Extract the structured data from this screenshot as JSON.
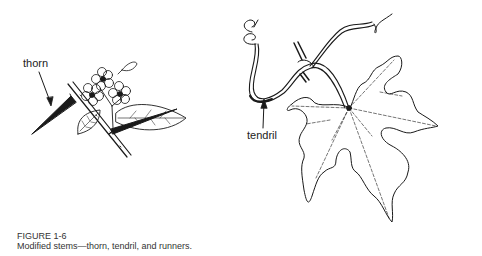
{
  "figure": {
    "number": "FIGURE 1-6",
    "caption": "Modified stems—thorn, tendril, and runners.",
    "labels": {
      "thorn": "thorn",
      "tendril": "tendril"
    },
    "illustrations": [
      {
        "name": "thorn-branch",
        "description": "Branch with sharp thorns, leaves and small five-petaled flowers"
      },
      {
        "name": "vine-leaf",
        "description": "Lobed vine leaf with coiled tendrils on a stem"
      }
    ],
    "colors": {
      "ink": "#1a1a1a",
      "paper": "#ffffff"
    }
  }
}
